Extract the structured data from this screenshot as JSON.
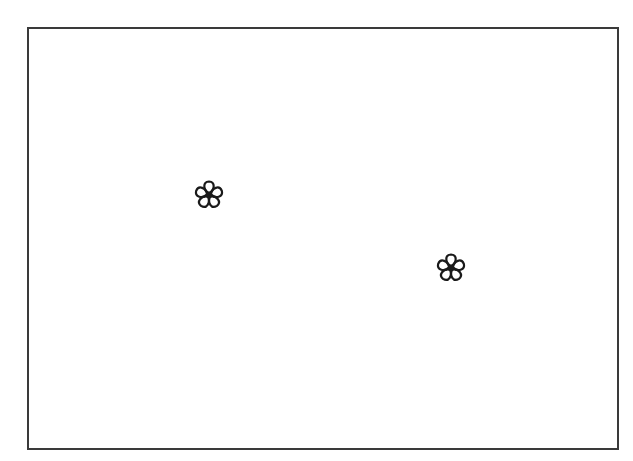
{
  "canvas": {
    "width": 633,
    "height": 461,
    "background": "#ffffff"
  },
  "frame": {
    "border_color": "#3a3a3a",
    "left": 27,
    "top": 27,
    "right": 617,
    "bottom": 448
  },
  "flowers": [
    {
      "icon": "flower-icon",
      "cx": 209,
      "cy": 195,
      "size": 32,
      "stroke": "#1a1a1a"
    },
    {
      "icon": "flower-icon",
      "cx": 451,
      "cy": 268,
      "size": 32,
      "stroke": "#1a1a1a"
    }
  ]
}
